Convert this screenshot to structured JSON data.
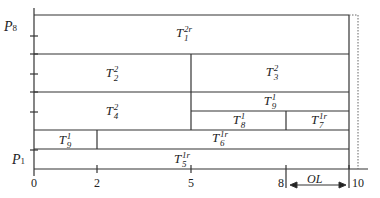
{
  "diagram": {
    "type": "gantt-like processor schedule",
    "y_axis": {
      "top_label": {
        "base": "P",
        "sub": "8"
      },
      "bottom_label": {
        "base": "P",
        "sub": "1"
      }
    },
    "x_axis": {
      "ticks": [
        "0",
        "2",
        "5",
        "8",
        "10"
      ]
    },
    "annotation": {
      "label": "OL",
      "from": "8",
      "to": "10"
    },
    "tasks": [
      {
        "id": "t1",
        "base": "T",
        "sub": "1",
        "sup": "2r",
        "span": "0-10",
        "row": "top"
      },
      {
        "id": "t2",
        "base": "T",
        "sub": "2",
        "sup": "2",
        "span": "0-5"
      },
      {
        "id": "t3",
        "base": "T",
        "sub": "3",
        "sup": "2",
        "span": "5-10"
      },
      {
        "id": "t4",
        "base": "T",
        "sub": "4",
        "sup": "2",
        "span": "0-5"
      },
      {
        "id": "t9a",
        "base": "T",
        "sub": "9",
        "sup": "1",
        "span": "5-10"
      },
      {
        "id": "t8",
        "base": "T",
        "sub": "8",
        "sup": "1",
        "span": "5-8"
      },
      {
        "id": "t7",
        "base": "T",
        "sub": "7",
        "sup": "1r",
        "span": "8-10"
      },
      {
        "id": "t9b",
        "base": "T",
        "sub": "9",
        "sup": "1",
        "span": "0-2"
      },
      {
        "id": "t6",
        "base": "T",
        "sub": "6",
        "sup": "1r",
        "span": "2-10"
      },
      {
        "id": "t5",
        "base": "T",
        "sub": "5",
        "sup": "1r",
        "span": "0-10"
      }
    ]
  }
}
